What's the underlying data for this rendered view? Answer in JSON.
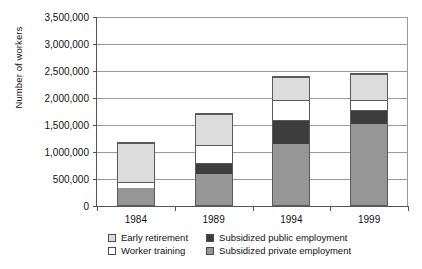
{
  "chart_data": {
    "type": "bar",
    "stacked": true,
    "title": "",
    "xlabel": "",
    "ylabel": "Number of workers",
    "categories": [
      "1984",
      "1989",
      "1994",
      "1999"
    ],
    "ylim": [
      0,
      3500000
    ],
    "ytick_values": [
      0,
      500000,
      1000000,
      1500000,
      2000000,
      2500000,
      3000000,
      3500000
    ],
    "ytick_labels": [
      "0",
      "500,000",
      "1,000,000",
      "1,500,000",
      "2,000,000",
      "2,500,000",
      "3,000,000",
      "3,500,000"
    ],
    "grid": true,
    "legend_position": "bottom",
    "series": [
      {
        "name": "Subsidized private employment",
        "color": "#969696",
        "values": [
          330000,
          610000,
          1170000,
          1550000
        ]
      },
      {
        "name": "Subsidized public employment",
        "color": "#3d3d3d",
        "values": [
          0,
          190000,
          440000,
          260000
        ]
      },
      {
        "name": "Worker training",
        "color": "#ffffff",
        "values": [
          110000,
          330000,
          370000,
          170000
        ]
      },
      {
        "name": "Early retirement",
        "color": "#dcdcdc",
        "values": [
          740000,
          590000,
          420000,
          480000
        ]
      }
    ],
    "totals": [
      1180000,
      1720000,
      2400000,
      2460000
    ]
  },
  "legend": {
    "items": [
      {
        "label": "Early retirement",
        "color": "#dcdcdc"
      },
      {
        "label": "Subsidized public employment",
        "color": "#3d3d3d"
      },
      {
        "label": "Worker training",
        "color": "#ffffff"
      },
      {
        "label": "Subsidized private employment",
        "color": "#969696"
      }
    ]
  },
  "colors": {
    "axis": "#555555",
    "grid": "#9a9a9a",
    "bar_outline": "#5a5a5a",
    "background": "#ffffff"
  }
}
